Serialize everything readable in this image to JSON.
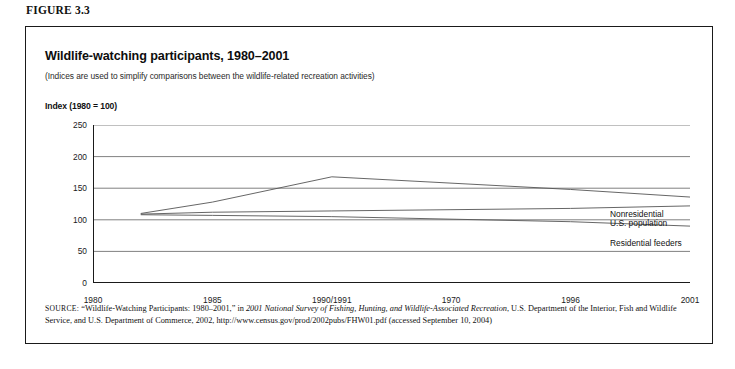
{
  "figure": {
    "caption": "FIGURE 3.3",
    "title": "Wildlife-watching participants, 1980–2001",
    "subtitle": "(Indices are used to simplify comparisons between the wildlife-related recreation activities)",
    "axis_label": "Index (1980 = 100)"
  },
  "source": {
    "prefix": "SOURCE:",
    "part1": " “Wildlife-Watching Participants: 1980–2001,” in ",
    "italic1": "2001 National Survey of Fishing, Hunting, and Wildlife-Associated Recreation",
    "part2": ", U.S. Department of the Interior, Fish and Wildlife Service, and U.S. Department of Commerce, 2002, http://www.census.gov/prod/2002pubs/FHW01.pdf (accessed September 10, 2004)"
  },
  "chart_data": {
    "type": "line",
    "title": "Wildlife-watching participants, 1980–2001",
    "subtitle": "(Indices are used to simplify comparisons between the wildlife-related recreation activities)",
    "xlabel": "",
    "ylabel": "Index (1980 = 100)",
    "ylim": [
      0,
      250
    ],
    "yticks": [
      0,
      50,
      100,
      150,
      200,
      250
    ],
    "xticks": [
      "1980",
      "1985",
      "1990/1991",
      "1970",
      "1996",
      "2001"
    ],
    "grid": true,
    "legend_position": "inline-right",
    "x": [
      1982,
      1985,
      1991,
      1996,
      2001
    ],
    "series": [
      {
        "name": "Nonresidential",
        "values": [
          110,
          128,
          168,
          148,
          136
        ],
        "color": "#555555"
      },
      {
        "name": "U.S. population",
        "values": [
          109,
          112,
          114,
          118,
          122
        ],
        "color": "#555555"
      },
      {
        "name": "Residential feeders",
        "values": [
          108,
          107,
          105,
          97,
          90
        ],
        "color": "#555555"
      }
    ]
  }
}
